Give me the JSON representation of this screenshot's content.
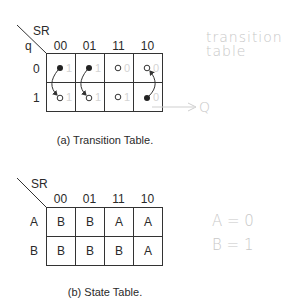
{
  "transition_table": {
    "corner_top": "SR",
    "corner_left": "q",
    "columns": [
      "00",
      "01",
      "11",
      "10"
    ],
    "rows": [
      "0",
      "1"
    ],
    "cells": [
      [
        {
          "dot": "filled",
          "note": "1"
        },
        {
          "dot": "filled",
          "note": "1"
        },
        {
          "dot": "open",
          "note": "0"
        },
        {
          "dot": "open",
          "note": "0"
        }
      ],
      [
        {
          "dot": "open",
          "note": "1"
        },
        {
          "dot": "open",
          "note": "1"
        },
        {
          "dot": "open",
          "note": "1"
        },
        {
          "dot": "filled",
          "note": "0"
        }
      ]
    ],
    "arrows": [
      {
        "col": "00",
        "from": "q=0 filled",
        "to": "q=1 open"
      },
      {
        "col": "01",
        "from": "q=0 filled",
        "to": "q=1 open"
      },
      {
        "col": "10",
        "from": "q=1 filled",
        "to": "q=0 open"
      }
    ],
    "caption": "(a) Transition Table.",
    "handwritten_note": "transition table",
    "handwritten_arrow_label": "Q"
  },
  "state_table": {
    "corner_top": "SR",
    "columns": [
      "00",
      "01",
      "11",
      "10"
    ],
    "rows": [
      "A",
      "B"
    ],
    "cells": [
      [
        "B",
        "B",
        "A",
        "A"
      ],
      [
        "B",
        "B",
        "B",
        "A"
      ]
    ],
    "caption": "(b) State Table.",
    "handwritten_notes": [
      "A = 0",
      "B = 1"
    ]
  }
}
